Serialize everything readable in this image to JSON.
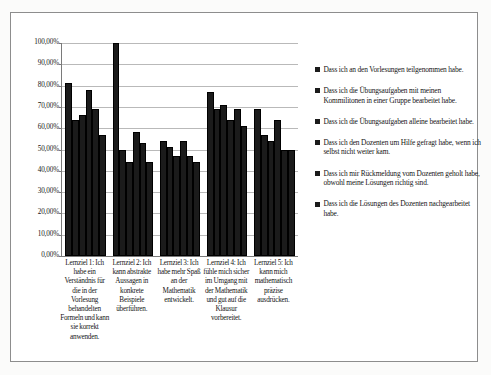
{
  "chart_data": {
    "type": "bar",
    "title": "",
    "subtitle": "",
    "xlabel": "",
    "ylabel": "",
    "ylim": [
      0,
      100
    ],
    "y_unit": "%",
    "grid": true,
    "legend_position": "right",
    "orientation": "vertical",
    "y_ticks": [
      "0,00%",
      "10,00%",
      "20,00%",
      "30,00%",
      "40,00%",
      "50,00%",
      "60,00%",
      "70,00%",
      "80,00%",
      "90,00%",
      "100,00%"
    ],
    "y_tick_values": [
      0,
      10,
      20,
      30,
      40,
      50,
      60,
      70,
      80,
      90,
      100
    ],
    "categories": [
      "Lernziel 1: Ich habe ein Verständnis für die in der Vorlesung behandelten Formeln und kann sie korrekt anwenden.",
      "Lernziel 2: Ich kann abstrakte Aussagen in konkrete Beispiele überführen.",
      "Lernziel 3: Ich habe mehr Spaß an der Mathematik entwickelt.",
      "Lernziel 4: Ich fühle mich sicher im Umgang mit der Mathematik und gut auf die Klausur vorbereitet.",
      "Lernziel 5: Ich kann mich mathematisch präzise ausdrücken."
    ],
    "series": [
      {
        "name": "Dass ich an den Vorlesungen teilgenommen habe.",
        "values": [
          81,
          100,
          54,
          77,
          69
        ]
      },
      {
        "name": "Dass ich die Übungsaufgaben mit meinen Kommilitonen in einer Gruppe bearbeitet habe.",
        "values": [
          64,
          50,
          51,
          69,
          57
        ]
      },
      {
        "name": "Dass ich die Übungsaufgaben alleine bearbeitet habe.",
        "values": [
          66,
          44,
          47,
          71,
          54
        ]
      },
      {
        "name": "Dass ich den Dozenten um Hilfe gefragt habe, wenn ich selbst nicht weiter kam.",
        "values": [
          78,
          58,
          54,
          64,
          64
        ]
      },
      {
        "name": "Dass ich mir Rückmeldung vom Dozenten geholt habe, obwohl meine Lösungen richtig sind.",
        "values": [
          69,
          53,
          47,
          69,
          50
        ]
      },
      {
        "name": "Dass ich die Lösungen des Dozenten nachgearbeitet habe.",
        "values": [
          57,
          44,
          44,
          61,
          50
        ]
      }
    ],
    "series_color": "#1b1b1b"
  }
}
